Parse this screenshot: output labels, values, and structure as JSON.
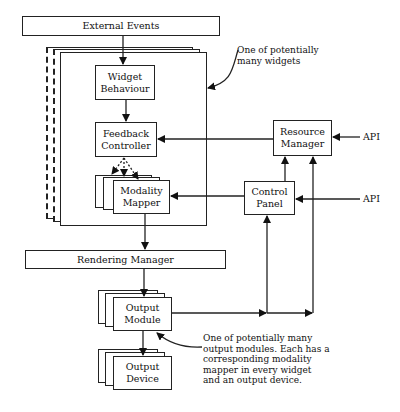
{
  "diagram": {
    "type": "architecture-block-diagram",
    "nodes": {
      "external_events": "External Events",
      "widget_behaviour": "Widget\nBehaviour",
      "feedback_controller": "Feedback\nController",
      "modality_mapper": "Modality\nMapper",
      "resource_manager": "Resource\nManager",
      "control_panel": "Control\nPanel",
      "rendering_manager": "Rendering Manager",
      "output_module": "Output\nModule",
      "output_device": "Output\nDevice",
      "api_top": "API",
      "api_bottom": "API"
    },
    "annotations": {
      "widget_note": "One of potentially\nmany widgets",
      "output_note": "One of potentially many\noutput modules. Each has a\ncorresponding modality\nmapper in every widget\nand an output device."
    },
    "edges": [
      {
        "from": "External Events",
        "to": "Widget Behaviour"
      },
      {
        "from": "Widget Behaviour",
        "to": "Feedback Controller"
      },
      {
        "from": "Resource Manager",
        "to": "Feedback Controller"
      },
      {
        "from": "Feedback Controller",
        "to": "Modality Mapper"
      },
      {
        "from": "Control Panel",
        "to": "Modality Mapper"
      },
      {
        "from": "Modality Mapper",
        "to": "Rendering Manager"
      },
      {
        "from": "Rendering Manager",
        "to": "Output Module"
      },
      {
        "from": "Output Module",
        "to": "Output Device"
      },
      {
        "from": "Output Module",
        "to": "Control Panel"
      },
      {
        "from": "Output Module",
        "to": "Resource Manager"
      },
      {
        "from": "Control Panel",
        "to": "Resource Manager"
      },
      {
        "from": "API",
        "to": "Resource Manager"
      },
      {
        "from": "API",
        "to": "Control Panel"
      }
    ]
  }
}
